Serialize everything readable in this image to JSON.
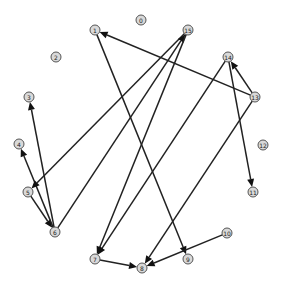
{
  "graph": {
    "type": "directed",
    "nodes": [
      {
        "id": "0",
        "label": "0"
      },
      {
        "id": "1",
        "label": "1"
      },
      {
        "id": "2",
        "label": "2"
      },
      {
        "id": "3",
        "label": "3"
      },
      {
        "id": "4",
        "label": "4"
      },
      {
        "id": "5",
        "label": "5"
      },
      {
        "id": "6",
        "label": "6"
      },
      {
        "id": "7",
        "label": "7"
      },
      {
        "id": "8",
        "label": "8"
      },
      {
        "id": "9",
        "label": "9"
      },
      {
        "id": "10",
        "label": "10"
      },
      {
        "id": "11",
        "label": "11"
      },
      {
        "id": "12",
        "label": "12"
      },
      {
        "id": "13",
        "label": "13"
      },
      {
        "id": "14",
        "label": "14"
      },
      {
        "id": "15",
        "label": "15"
      }
    ],
    "edges": [
      {
        "from": "13",
        "to": "1"
      },
      {
        "from": "13",
        "to": "14"
      },
      {
        "from": "13",
        "to": "8"
      },
      {
        "from": "14",
        "to": "11"
      },
      {
        "from": "14",
        "to": "7"
      },
      {
        "from": "1",
        "to": "9"
      },
      {
        "from": "10",
        "to": "8"
      },
      {
        "from": "7",
        "to": "8"
      },
      {
        "from": "5",
        "to": "6"
      },
      {
        "from": "6",
        "to": "4"
      },
      {
        "from": "6",
        "to": "3"
      },
      {
        "from": "15",
        "to": "5"
      },
      {
        "from": "6",
        "to": "15"
      },
      {
        "from": "15",
        "to": "7"
      }
    ],
    "colors": {
      "node_fill": "#d9d9d9",
      "node_stroke": "#555555",
      "edge": "#222222"
    }
  }
}
